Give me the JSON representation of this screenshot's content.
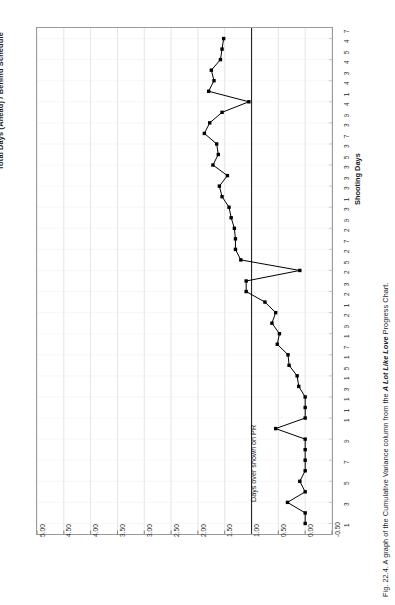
{
  "figure": {
    "chart_title": "Total Days (Ahead) / Behind Schedule",
    "x_axis_title": "Shooting Days",
    "annotation": "Days over shown on PR",
    "caption_prefix": "Fig. 22.4. A graph of the Cumulative Variance column from the ",
    "caption_italic": "A Lot Like Love",
    "caption_suffix": " Progress Chart."
  },
  "chart_data": {
    "type": "line",
    "title": "Total Days (Ahead) / Behind Schedule",
    "xlabel": "Shooting Days",
    "ylabel": "Days (Ahead) / Behind",
    "orientation": "rotated-90-ccw",
    "grid": true,
    "legend": false,
    "xlim": [
      0,
      48
    ],
    "ylim": [
      -0.5,
      5.0
    ],
    "ytick_labels": [
      "5.00",
      "4.50",
      "4.00",
      "3.50",
      "3.00",
      "2.50",
      "2.00",
      "1.50",
      "1.00",
      "0.50",
      "0.00",
      "-0.50"
    ],
    "ytick_values": [
      5.0,
      4.5,
      4.0,
      3.5,
      3.0,
      2.5,
      2.0,
      1.5,
      1.0,
      0.5,
      0.0,
      -0.5
    ],
    "xtick_labels": [
      "1",
      "3",
      "5",
      "7",
      "9",
      "11",
      "13",
      "15",
      "17",
      "19",
      "21",
      "23",
      "25",
      "27",
      "29",
      "31",
      "33",
      "35",
      "37",
      "39",
      "41",
      "43",
      "45",
      "47"
    ],
    "xtick_values": [
      1,
      3,
      5,
      7,
      9,
      11,
      13,
      15,
      17,
      19,
      21,
      23,
      25,
      27,
      29,
      31,
      33,
      35,
      37,
      39,
      41,
      43,
      45,
      47
    ],
    "reference_line": {
      "value": 1.0,
      "label": "Days over shown on PR",
      "axis": "y"
    },
    "marker": "square",
    "marker_color": "#000000",
    "line_color": "#000000",
    "x": [
      1,
      2,
      3,
      4,
      5,
      6,
      7,
      8,
      9,
      10,
      11,
      12,
      13,
      14,
      15,
      16,
      17,
      18,
      19,
      20,
      21,
      22,
      23,
      24,
      25,
      26,
      27,
      28,
      29,
      30,
      31,
      32,
      33,
      34,
      35,
      36,
      37,
      38,
      39,
      40,
      41,
      42,
      43,
      44,
      45,
      46,
      47
    ],
    "values": [
      0.0,
      0.0,
      0.33,
      0.0,
      0.1,
      0.0,
      0.0,
      0.0,
      0.0,
      0.55,
      0.0,
      0.0,
      0.0,
      0.12,
      0.15,
      0.3,
      0.32,
      0.52,
      0.48,
      0.62,
      0.55,
      0.75,
      1.1,
      1.1,
      0.1,
      1.2,
      1.3,
      1.3,
      1.32,
      1.38,
      1.42,
      1.55,
      1.6,
      1.45,
      1.72,
      1.62,
      1.65,
      1.88,
      1.78,
      1.55,
      1.05,
      1.8,
      1.7,
      1.75,
      1.58,
      1.55,
      1.52
    ]
  }
}
